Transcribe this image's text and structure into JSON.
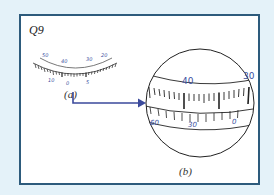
{
  "question_label": "Q9",
  "figure_a": {
    "label": "(a)",
    "upper_scale_labels": [
      "50",
      "40",
      "30",
      "20"
    ],
    "lower_scale_labels": [
      "10",
      "0",
      "5"
    ]
  },
  "figure_b": {
    "label": "(b)",
    "upper_scale_labels": [
      "40",
      "30"
    ],
    "lower_scale_labels": [
      "60",
      "30",
      "0"
    ]
  },
  "colors": {
    "background": "#e4f2f9",
    "frame_border": "#2d5b7c",
    "label_blue": "#3a4fa0",
    "arrow": "#3b4a9c"
  }
}
